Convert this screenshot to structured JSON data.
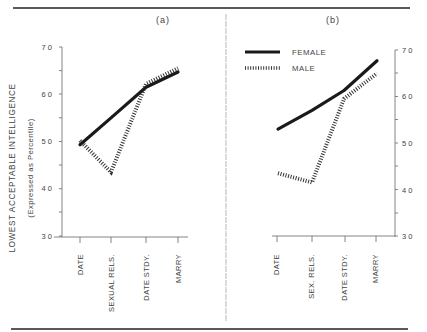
{
  "panels": {
    "a": {
      "label": "(a)"
    },
    "b": {
      "label": "(b)"
    }
  },
  "y_axis": {
    "title": "LOWEST ACCEPTABLE INTELLIGENCE",
    "subtitle": "(Expressed  as  Percentile)",
    "ticks": [
      "7 0",
      "6 0",
      "5 0",
      "4 0",
      "3 0"
    ]
  },
  "legend": {
    "female": "FEMALE",
    "male": "MALE"
  },
  "colors": {
    "line": "#1a1a1a",
    "axis": "#777777",
    "rule": "#222222"
  },
  "chart_data": [
    {
      "type": "line",
      "title": "(a)",
      "xlabel": "",
      "ylabel": "LOWEST ACCEPTABLE INTELLIGENCE (Expressed as Percentile)",
      "ylim": [
        30,
        70
      ],
      "yticks": [
        30,
        40,
        50,
        60,
        70
      ],
      "categories": [
        "DATE",
        "SEXUAL RELS.",
        "DATE STDY.",
        "MARRY"
      ],
      "series": [
        {
          "name": "FEMALE",
          "style": "solid",
          "values": [
            49.3,
            55.0,
            61.5,
            64.7
          ]
        },
        {
          "name": "MALE",
          "style": "hatched",
          "values": [
            50.2,
            43.5,
            62.2,
            65.5
          ]
        }
      ],
      "grid": false,
      "y_axis_side": "left"
    },
    {
      "type": "line",
      "title": "(b)",
      "xlabel": "",
      "ylabel": "",
      "ylim": [
        30,
        70
      ],
      "yticks": [
        30,
        40,
        50,
        60,
        70
      ],
      "categories": [
        "DATE",
        "SEX. RELS.",
        "DATE STDY.",
        "MARRY"
      ],
      "series": [
        {
          "name": "FEMALE",
          "style": "solid",
          "values": [
            53.0,
            57.0,
            61.3,
            67.7
          ]
        },
        {
          "name": "MALE",
          "style": "hatched",
          "values": [
            43.5,
            41.5,
            59.5,
            65.0
          ]
        }
      ],
      "grid": false,
      "y_axis_side": "right",
      "legend_position": "upper-left"
    }
  ]
}
